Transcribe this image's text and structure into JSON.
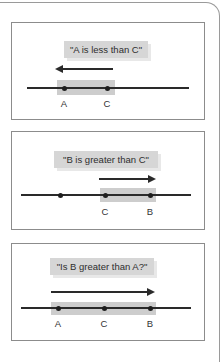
{
  "colors": {
    "label_box": "#d6d6d6",
    "label_shadow": "#e8e8e8",
    "highlight": "#cdcdcd",
    "line": "#2a2a2a",
    "panel_border": "#8c8c8c"
  },
  "panels": [
    {
      "caption": "\"A is less than C\"",
      "arrow_direction": "left",
      "points": [
        {
          "label": "A"
        },
        {
          "label": "C"
        }
      ]
    },
    {
      "caption": "\"B is greater than C\"",
      "arrow_direction": "right",
      "points": [
        {
          "label": ""
        },
        {
          "label": "C"
        },
        {
          "label": "B"
        }
      ]
    },
    {
      "caption": "\"Is B greater than A?\"",
      "arrow_direction": "right",
      "points": [
        {
          "label": "A"
        },
        {
          "label": "C"
        },
        {
          "label": "B"
        }
      ]
    }
  ]
}
